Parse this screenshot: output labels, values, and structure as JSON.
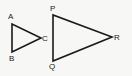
{
  "diagram": {
    "type": "similar-triangles",
    "triangles": [
      {
        "name": "ABC",
        "vertices": [
          {
            "label": "A",
            "x": 12,
            "y": 24,
            "lx": 8,
            "ly": 19
          },
          {
            "label": "B",
            "x": 12,
            "y": 52,
            "lx": 9,
            "ly": 61
          },
          {
            "label": "C",
            "x": 41,
            "y": 38,
            "lx": 42,
            "ly": 41
          }
        ]
      },
      {
        "name": "PQR",
        "vertices": [
          {
            "label": "P",
            "x": 53,
            "y": 15,
            "lx": 50,
            "ly": 11
          },
          {
            "label": "Q",
            "x": 53,
            "y": 61,
            "lx": 49,
            "ly": 69
          },
          {
            "label": "R",
            "x": 112,
            "y": 37,
            "lx": 114,
            "ly": 40
          }
        ]
      }
    ],
    "colors": {
      "stroke": "#1a1a1a",
      "label": "#222222",
      "background": "#f7f7f5"
    }
  }
}
